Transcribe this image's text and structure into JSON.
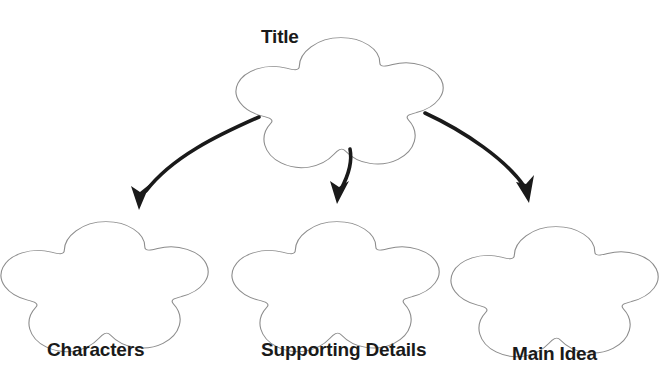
{
  "diagram": {
    "type": "graphic-organizer",
    "title_text": "Title",
    "background_color": "#ffffff",
    "shape_outline_color": "#8c8c8c",
    "shape_fill_color": "#ffffff",
    "arrow_color": "#1a1a1a",
    "label_color": "#1a1a1a",
    "nodes": [
      {
        "id": "title",
        "label": "Title",
        "shape": "five-lobed-flower",
        "center_x": 341,
        "center_y": 86,
        "radius": 62,
        "label_position": "above-left"
      },
      {
        "id": "characters",
        "label": "Characters",
        "shape": "five-lobed-flower",
        "center_x": 106,
        "center_y": 270,
        "radius": 62,
        "label_position": "below"
      },
      {
        "id": "supporting-details",
        "label": "Supporting Details",
        "shape": "five-lobed-flower",
        "center_x": 337,
        "center_y": 270,
        "radius": 62,
        "label_position": "below"
      },
      {
        "id": "main-idea",
        "label": "Main Idea",
        "shape": "five-lobed-flower",
        "center_x": 556,
        "center_y": 275,
        "radius": 62,
        "label_position": "below"
      }
    ],
    "connectors": [
      {
        "id": "title-to-characters",
        "from": "title",
        "to": "characters",
        "style": "curved-arrow",
        "direction": "down-left"
      },
      {
        "id": "title-to-supporting-details",
        "from": "title",
        "to": "supporting-details",
        "style": "curved-arrow",
        "direction": "down"
      },
      {
        "id": "title-to-main-idea",
        "from": "title",
        "to": "main-idea",
        "style": "curved-arrow",
        "direction": "down-right"
      }
    ]
  }
}
